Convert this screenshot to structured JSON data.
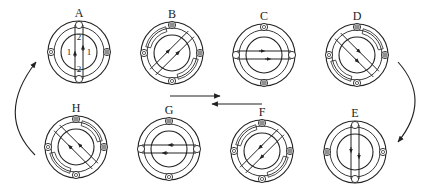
{
  "diagram": {
    "stroke_color": "#222222",
    "background": "#ffffff",
    "stages": [
      {
        "id": "A",
        "label": "A",
        "cx": 79,
        "cy": 52,
        "angle": 90,
        "arrow_dir": "up",
        "labels": {
          "side_left": "1",
          "side_right": "1",
          "top": "2",
          "bottom": "2"
        },
        "pin_pos": "vertical"
      },
      {
        "id": "B",
        "label": "B",
        "cx": 172,
        "cy": 53,
        "angle": 45,
        "arrow_dir": "up-right",
        "pin_pos": "cross"
      },
      {
        "id": "C",
        "label": "C",
        "cx": 264,
        "cy": 55,
        "angle": 0,
        "arrow_dir": "right",
        "pin_pos": "horizontal"
      },
      {
        "id": "D",
        "label": "D",
        "cx": 357,
        "cy": 55,
        "angle": -45,
        "arrow_dir": "down-right",
        "pin_pos": "cross"
      },
      {
        "id": "E",
        "label": "E",
        "cx": 355,
        "cy": 152,
        "angle": 90,
        "arrow_dir": "down",
        "pin_pos": "vertical"
      },
      {
        "id": "F",
        "label": "F",
        "cx": 262,
        "cy": 151,
        "angle": 45,
        "arrow_dir": "down-left",
        "pin_pos": "cross"
      },
      {
        "id": "G",
        "label": "G",
        "cx": 169,
        "cy": 149,
        "angle": 0,
        "arrow_dir": "left",
        "pin_pos": "horizontal"
      },
      {
        "id": "H",
        "label": "H",
        "cx": 76,
        "cy": 147,
        "angle": -45,
        "arrow_dir": "up-left",
        "pin_pos": "cross"
      }
    ],
    "flow_arrows": [
      {
        "name": "top-to-right",
        "direction": "right",
        "from": [
          170,
          96
        ],
        "to": [
          222,
          96
        ]
      },
      {
        "name": "bottom-to-left",
        "direction": "left",
        "from": [
          262,
          104
        ],
        "to": [
          210,
          104
        ]
      },
      {
        "name": "curve-d-to-e",
        "direction": "clockwise-down"
      },
      {
        "name": "curve-h-to-a",
        "direction": "clockwise-up"
      }
    ]
  }
}
